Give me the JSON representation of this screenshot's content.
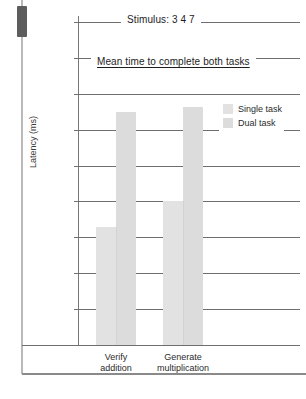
{
  "chart_data": {
    "type": "bar",
    "title": "Stimulus:  3 4 7",
    "subtitle": "Mean time to complete both tasks",
    "xlabel": "",
    "ylabel": "Latency (ms)",
    "ylim": [
      0,
      2250
    ],
    "ytick_labels": [
      "2250",
      "2000",
      "1750",
      "1500",
      "1250",
      "1000",
      "750",
      "500",
      "250",
      "0"
    ],
    "ytick_values": [
      2250,
      2000,
      1750,
      1500,
      1250,
      1000,
      750,
      500,
      250,
      0
    ],
    "grid": true,
    "legend_position": "upper right",
    "categories": [
      "Verify addition",
      "Generate multiplication"
    ],
    "category_lines": [
      [
        "Verify",
        "addition"
      ],
      [
        "Generate",
        "multiplication"
      ]
    ],
    "series": [
      {
        "name": "Single task",
        "color": "#e2e2e2",
        "values": [
          820,
          1000
        ]
      },
      {
        "name": "Dual task",
        "color": "#dcdcdc",
        "values": [
          1620,
          1660
        ]
      }
    ]
  },
  "legend": {
    "items": [
      {
        "label": "Single task"
      },
      {
        "label": "Dual task"
      }
    ]
  },
  "scrollbar": {
    "name": "vertical-scrollbar"
  }
}
